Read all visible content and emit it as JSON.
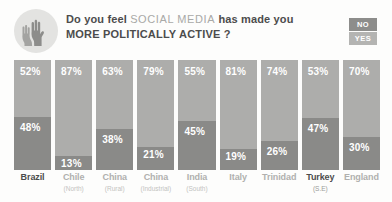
{
  "header": {
    "icon": "raised-hands-icon",
    "title_part1": "Do you feel",
    "title_highlight": "SOCIAL MEDIA",
    "title_part2": "has made you",
    "title_line2": "MORE POLITICALLY ACTIVE ?"
  },
  "legend": {
    "no_label": "NO",
    "yes_label": "YES",
    "no_color": "#8d8d8b",
    "yes_color": "#b4b4b2"
  },
  "colors": {
    "no_bar": "#adadab",
    "yes_bar": "#8a8a88",
    "accent_text": "#4c4c4c",
    "muted_text": "#b0b0ae",
    "background": "#fdfdfc"
  },
  "chart_data": {
    "type": "bar",
    "title": "Do you feel SOCIAL MEDIA has made you MORE POLITICALLY ACTIVE ?",
    "subtype": "100% stacked vertical",
    "xlabel": "",
    "ylabel": "",
    "ylim": [
      0,
      100
    ],
    "grid": false,
    "legend_position": "top-right",
    "categories": [
      "Brazil",
      "Chile",
      "China",
      "China",
      "India",
      "Italy",
      "Trinidad",
      "Turkey",
      "England"
    ],
    "sublabels": [
      "",
      "(North)",
      "(Rural)",
      "(Industrial)",
      "(South)",
      "",
      "",
      "(S.E)",
      ""
    ],
    "series": [
      {
        "name": "NO",
        "values": [
          52,
          87,
          63,
          79,
          55,
          81,
          74,
          53,
          70
        ]
      },
      {
        "name": "YES",
        "values": [
          48,
          13,
          38,
          21,
          45,
          19,
          26,
          47,
          30
        ]
      }
    ],
    "value_labels": {
      "no": [
        "52%",
        "87%",
        "63%",
        "79%",
        "55%",
        "81%",
        "74%",
        "53%",
        "70%"
      ],
      "yes": [
        "48%",
        "13%",
        "38%",
        "21%",
        "45%",
        "19%",
        "26%",
        "47%",
        "30%"
      ]
    },
    "highlighted_categories": [
      "Brazil",
      "Turkey"
    ]
  },
  "bars": [
    {
      "country": "Brazil",
      "region": "",
      "no": "52%",
      "yes": "48%",
      "no_pct": 52,
      "yes_pct": 48,
      "accent": true
    },
    {
      "country": "Chile",
      "region": "(North)",
      "no": "87%",
      "yes": "13%",
      "no_pct": 87,
      "yes_pct": 13,
      "accent": false
    },
    {
      "country": "China",
      "region": "(Rural)",
      "no": "63%",
      "yes": "38%",
      "no_pct": 63,
      "yes_pct": 37,
      "accent": false
    },
    {
      "country": "China",
      "region": "(Industrial)",
      "no": "79%",
      "yes": "21%",
      "no_pct": 79,
      "yes_pct": 21,
      "accent": false
    },
    {
      "country": "India",
      "region": "(South)",
      "no": "55%",
      "yes": "45%",
      "no_pct": 55,
      "yes_pct": 45,
      "accent": false
    },
    {
      "country": "Italy",
      "region": "",
      "no": "81%",
      "yes": "19%",
      "no_pct": 81,
      "yes_pct": 19,
      "accent": false
    },
    {
      "country": "Trinidad",
      "region": "",
      "no": "74%",
      "yes": "26%",
      "no_pct": 74,
      "yes_pct": 26,
      "accent": false
    },
    {
      "country": "Turkey",
      "region": "(S.E)",
      "no": "53%",
      "yes": "47%",
      "no_pct": 53,
      "yes_pct": 47,
      "accent": true
    },
    {
      "country": "England",
      "region": "",
      "no": "70%",
      "yes": "30%",
      "no_pct": 70,
      "yes_pct": 30,
      "accent": false
    }
  ]
}
